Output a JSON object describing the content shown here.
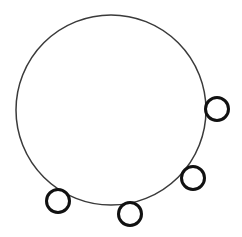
{
  "diagram": {
    "background": "#ffffff",
    "main_circle": {
      "cx": 111,
      "cy": 110,
      "r": 95,
      "stroke": "#3a3a3a",
      "stroke_width": 1.5
    },
    "small_circles": [
      {
        "cx": 217,
        "cy": 109,
        "r": 11.5,
        "stroke": "#111111",
        "stroke_width": 3
      },
      {
        "cx": 193,
        "cy": 178,
        "r": 11.5,
        "stroke": "#111111",
        "stroke_width": 3
      },
      {
        "cx": 130,
        "cy": 214,
        "r": 11.5,
        "stroke": "#111111",
        "stroke_width": 3
      },
      {
        "cx": 58,
        "cy": 201,
        "r": 11.5,
        "stroke": "#111111",
        "stroke_width": 3
      }
    ]
  }
}
